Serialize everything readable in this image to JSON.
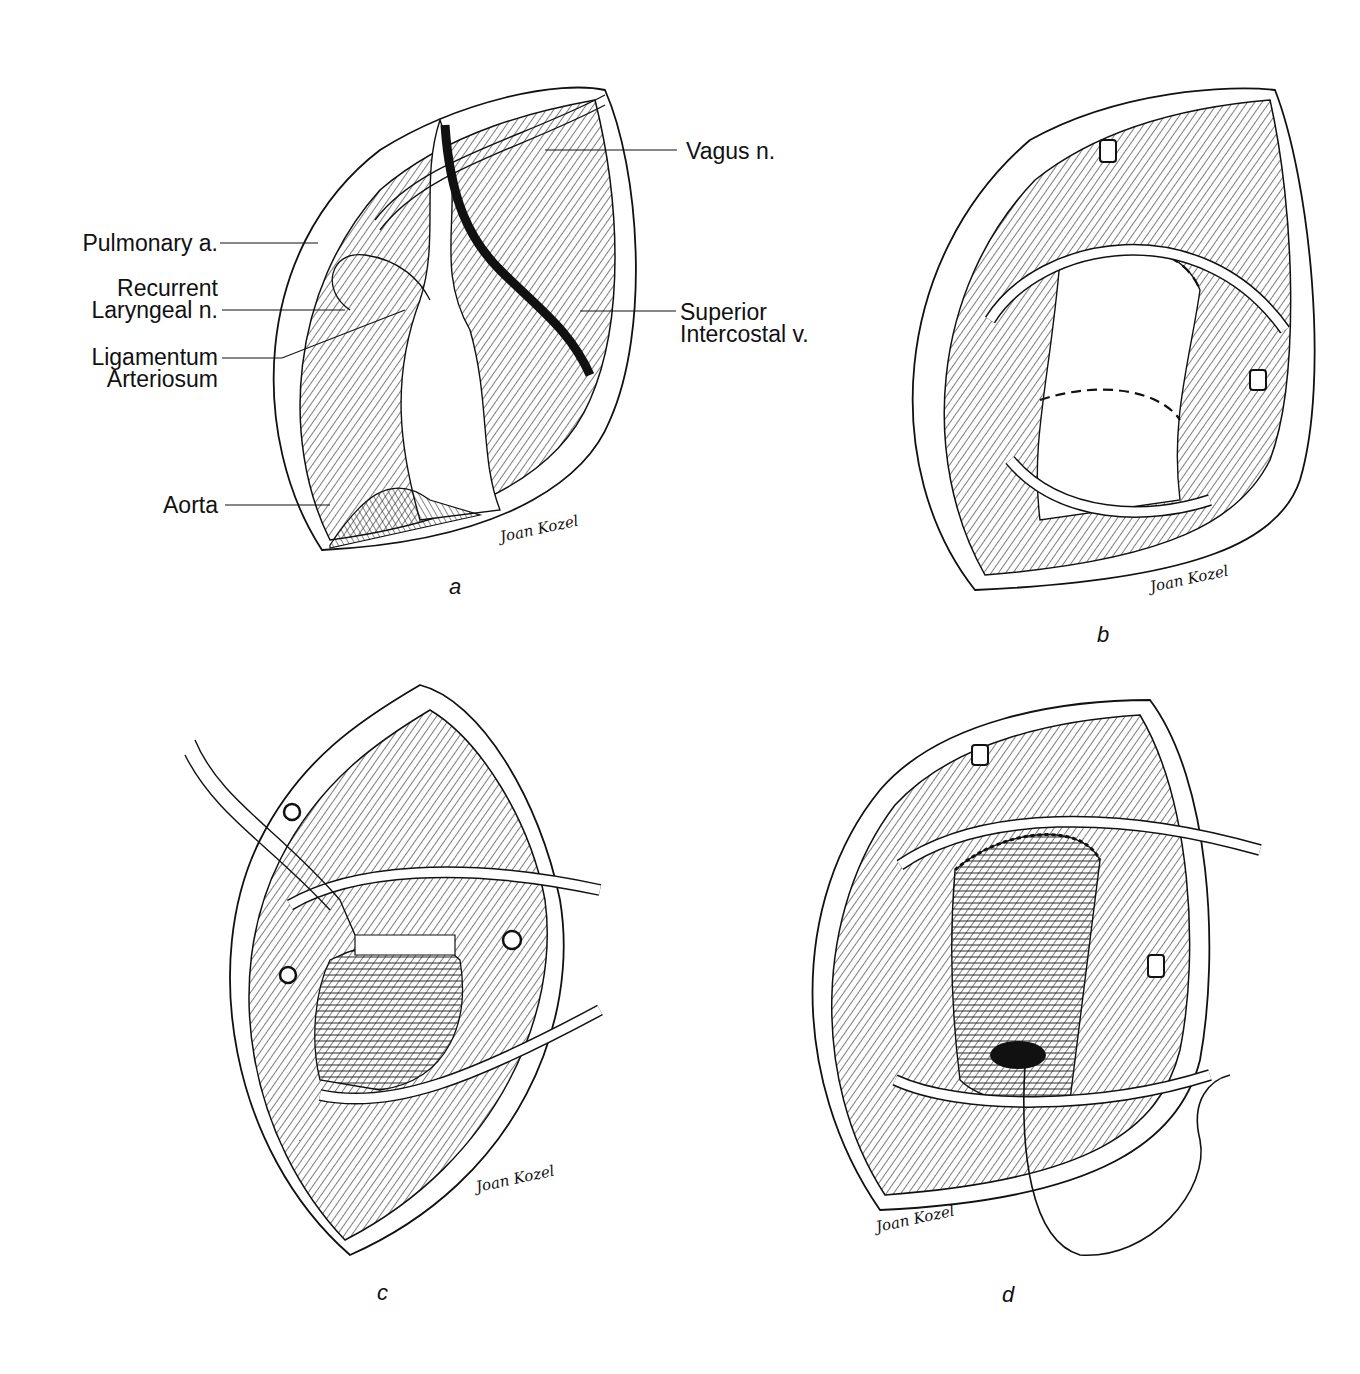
{
  "figure": {
    "panels": [
      {
        "id": "a",
        "letter": "a",
        "signature": "Joan Kozel",
        "labels": {
          "pulmonary_a": "Pulmonary a.",
          "recurrent_1": "Recurrent",
          "recurrent_2": "Laryngeal n.",
          "ligamentum_1": "Ligamentum",
          "ligamentum_2": "Arteriosum",
          "aorta": "Aorta",
          "vagus": "Vagus n.",
          "superior_1": "Superior",
          "superior_2": "Intercostal v."
        }
      },
      {
        "id": "b",
        "letter": "b",
        "signature": "Joan Kozel"
      },
      {
        "id": "c",
        "letter": "c",
        "signature": "Joan Kozel"
      },
      {
        "id": "d",
        "letter": "d",
        "signature": "Joan Kozel"
      }
    ],
    "colors": {
      "ink": "#111111",
      "background": "#ffffff"
    }
  }
}
